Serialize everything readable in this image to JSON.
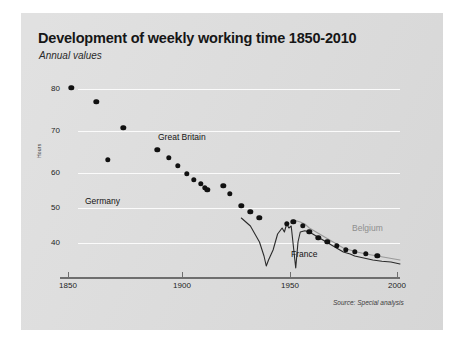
{
  "header": {
    "title": "Development of weekly working time 1850-2010",
    "subtitle": "Annual values",
    "source": "Source: Special analysis"
  },
  "labels": {
    "great_britain": "Great Britain",
    "germany": "Germany",
    "belgium": "Belgium",
    "france": "France",
    "hours_axis": "Hours"
  },
  "colors": {
    "panel": "#dedede",
    "grid": "#fbfbfb",
    "axis": "#6e6e6e",
    "dots": "#111111",
    "france_line": "#2b2b2b",
    "belgium_line": "#9a9a9a",
    "title": "#161616"
  },
  "chart_data": {
    "type": "scatter",
    "title": "Development of weekly working time 1850-2010",
    "subtitle": "Annual values",
    "xlabel": "",
    "ylabel": "Hours",
    "xlim": [
      1850,
      2000
    ],
    "ylim": [
      35,
      85
    ],
    "xticks": [
      1850,
      1900,
      1950,
      2000
    ],
    "yticks": [
      40,
      50,
      60,
      70,
      80
    ],
    "grid": true,
    "legend": "inline-annotations",
    "source": "Source: Special analysis",
    "series": [
      {
        "name": "Germany",
        "style": "dots",
        "color": "#111111",
        "points": [
          [
            1855,
            82.5
          ],
          [
            1866,
            79.0
          ],
          [
            1878,
            72.5
          ],
          [
            1871,
            64.5
          ],
          [
            1893,
            67.0
          ],
          [
            1898,
            65.0
          ],
          [
            1902,
            63.0
          ],
          [
            1906,
            61.0
          ],
          [
            1909,
            59.5
          ],
          [
            1912,
            58.5
          ],
          [
            1914,
            57.5
          ],
          [
            1915,
            57.0
          ],
          [
            1922,
            58.0
          ],
          [
            1925,
            56.0
          ],
          [
            1930,
            53.0
          ],
          [
            1934,
            51.5
          ],
          [
            1938,
            50.0
          ],
          [
            1950,
            48.5
          ],
          [
            1953,
            49.0
          ],
          [
            1957,
            48.0
          ],
          [
            1960,
            46.5
          ],
          [
            1964,
            45.0
          ],
          [
            1968,
            44.0
          ],
          [
            1972,
            43.0
          ],
          [
            1976,
            42.0
          ],
          [
            1980,
            41.5
          ],
          [
            1985,
            41.0
          ],
          [
            1990,
            40.5
          ]
        ]
      },
      {
        "name": "France",
        "style": "line",
        "color": "#2b2b2b",
        "points": [
          [
            1930,
            50.0
          ],
          [
            1932,
            49.0
          ],
          [
            1934,
            48.0
          ],
          [
            1936,
            46.0
          ],
          [
            1938,
            44.0
          ],
          [
            1940,
            40.5
          ],
          [
            1941,
            38.0
          ],
          [
            1942,
            39.5
          ],
          [
            1944,
            42.0
          ],
          [
            1946,
            46.0
          ],
          [
            1948,
            47.5
          ],
          [
            1949,
            46.5
          ],
          [
            1950,
            48.5
          ],
          [
            1951,
            47.5
          ],
          [
            1952,
            48.0
          ],
          [
            1954,
            37.5
          ],
          [
            1955,
            44.0
          ],
          [
            1956,
            46.5
          ],
          [
            1958,
            46.8
          ],
          [
            1960,
            46.5
          ],
          [
            1963,
            45.5
          ],
          [
            1966,
            44.5
          ],
          [
            1969,
            43.5
          ],
          [
            1972,
            42.5
          ],
          [
            1975,
            41.5
          ],
          [
            1978,
            41.0
          ],
          [
            1980,
            40.5
          ],
          [
            1984,
            40.0
          ],
          [
            1988,
            39.5
          ],
          [
            1992,
            39.2
          ],
          [
            1996,
            39.0
          ],
          [
            2000,
            38.5
          ]
        ]
      },
      {
        "name": "Belgium",
        "style": "line",
        "color": "#9a9a9a",
        "points": [
          [
            1953,
            49.5
          ],
          [
            1956,
            49.0
          ],
          [
            1958,
            48.5
          ],
          [
            1960,
            47.5
          ],
          [
            1963,
            46.5
          ],
          [
            1966,
            45.5
          ],
          [
            1969,
            44.5
          ],
          [
            1972,
            43.5
          ],
          [
            1975,
            42.5
          ],
          [
            1978,
            42.0
          ],
          [
            1981,
            41.5
          ],
          [
            1985,
            41.0
          ],
          [
            1990,
            40.5
          ],
          [
            1995,
            40.0
          ],
          [
            2000,
            39.5
          ]
        ]
      }
    ],
    "annotations": [
      {
        "text": "Great Britain",
        "x": 1905,
        "y": 69.5
      },
      {
        "text": "Germany",
        "x": 1866,
        "y": 54.5
      },
      {
        "text": "Belgium",
        "x": 1983,
        "y": 45.0
      },
      {
        "text": "France",
        "x": 1959,
        "y": 38.8
      }
    ]
  },
  "axis": {
    "y_ticks": [
      {
        "label": "80",
        "top": 89
      },
      {
        "label": "70",
        "top": 131
      },
      {
        "label": "60",
        "top": 173
      },
      {
        "label": "50",
        "top": 208
      },
      {
        "label": "40",
        "top": 243
      }
    ],
    "x_ticks": [
      {
        "label": "1850",
        "left": 68
      },
      {
        "label": "1900",
        "left": 182
      },
      {
        "label": "1950",
        "left": 290
      },
      {
        "label": "2000",
        "left": 397
      }
    ]
  }
}
